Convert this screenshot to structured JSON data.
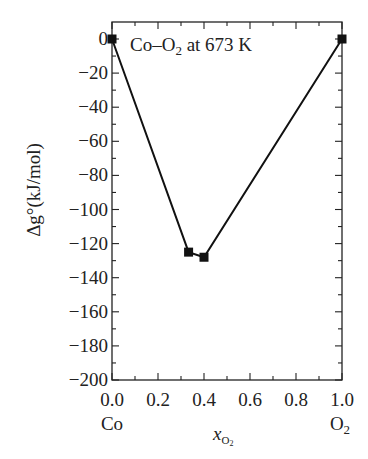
{
  "chart_data": {
    "type": "line",
    "title": "",
    "annotation": "Co–O2 at 673 K",
    "xlabel": "x_O2",
    "ylabel": "Δg° (kJ/mol)",
    "xlim": [
      0.0,
      1.0
    ],
    "ylim": [
      -200,
      0
    ],
    "xticks": [
      0.0,
      0.2,
      0.4,
      0.6,
      0.8,
      1.0
    ],
    "xtick_labels": [
      "0.0",
      "0.2",
      "0.4",
      "0.6",
      "0.8",
      "1.0"
    ],
    "x_minor_step": 0.1,
    "yticks": [
      0,
      -20,
      -40,
      -60,
      -80,
      -100,
      -120,
      -140,
      -160,
      -180,
      -200
    ],
    "ytick_labels": [
      "0",
      "−20",
      "−40",
      "−60",
      "−80",
      "−100",
      "−120",
      "−140",
      "−160",
      "−180",
      "−200"
    ],
    "y_minor_step": 10,
    "end_labels": {
      "left": "Co",
      "right": "O2"
    },
    "grid": false,
    "legend": null,
    "series": [
      {
        "name": "Co–O2 at 673 K",
        "marker": "square",
        "color": "#111111",
        "x": [
          0.0,
          0.333,
          0.4,
          1.0
        ],
        "y": [
          0,
          -125,
          -128,
          0
        ]
      }
    ]
  },
  "labels": {
    "annotation_main": "Co–O",
    "annotation_sub": "2",
    "annotation_rest": " at 673 K",
    "left_component": "Co",
    "right_component_main": "O",
    "right_component_sub": "2",
    "xlabel_main": "x",
    "xlabel_sub": "O",
    "xlabel_subsub": "2",
    "ylabel": "Δg°(kJ/mol)"
  }
}
